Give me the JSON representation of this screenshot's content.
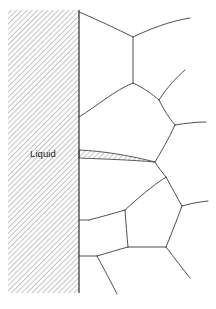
{
  "figure": {
    "type": "materials-microstructure-schematic",
    "width": 216,
    "height": 309,
    "background_color": "#ffffff"
  },
  "labels": {
    "liquid": "Liquid"
  },
  "colors": {
    "grain_boundary_line": "#3c3c3c",
    "interface_line": "#2b2b2b",
    "hatch_line": "#9a9a9a",
    "hatch_background": "#ffffff",
    "label_text": "#1a1a1a"
  },
  "regions": {
    "liquid_reservoir": {
      "name": "liquid-region",
      "fill": "diagonal-hatch",
      "hatch_angle_deg": 45,
      "hatch_spacing_px": 2.6,
      "bounds": {
        "x": 8,
        "y": 10,
        "width": 71,
        "height": 283
      }
    },
    "liquid_film": {
      "name": "liquid-penetration-wedge",
      "fill": "diagonal-hatch",
      "description": "thin wedge of liquid along grain boundary",
      "tip_x": 155,
      "tip_y": 162
    }
  },
  "geometry": {
    "interface_line": {
      "x": 79,
      "y_top": 10,
      "y_bottom": 293
    },
    "hatch_rect": {
      "x": 8,
      "y": 10,
      "width": 71,
      "height": 283
    },
    "liquid_label_pos": {
      "x": 30,
      "y": 157
    },
    "wedge_path": "M 79,150 C 104,151 132,156 155,162 C 132,160 104,159 79,158 Z",
    "grain_boundaries": [
      {
        "name": "gb-top-left-branch",
        "d": "M 79,12 C 96,19 117,29 133,37"
      },
      {
        "name": "gb-top-right-branch",
        "d": "M 133,37 C 150,29 170,21 190,18"
      },
      {
        "name": "gb-top-stem",
        "d": "M 133,37 C 133,56 133,70 133,83"
      },
      {
        "name": "gb-upper-left-face",
        "d": "M 133,83 C 115,90 97,106 79,117"
      },
      {
        "name": "gb-upper-right-face",
        "d": "M 133,83 C 144,88 152,94 159,100"
      },
      {
        "name": "gb-upper-right-spur",
        "d": "M 159,100 C 168,86 177,77 185,70"
      },
      {
        "name": "gb-right-face",
        "d": "M 159,100 C 164,110 169,118 175,125"
      },
      {
        "name": "gb-right-spur",
        "d": "M 175,125 C 187,123 197,122 206,122"
      },
      {
        "name": "gb-right-lower-face",
        "d": "M 175,125 C 168,140 161,152 155,162"
      },
      {
        "name": "gb-wedge-to-junction",
        "d": "M 155,162 C 158,167 162,172 166,177"
      },
      {
        "name": "gb-mid-right-face",
        "d": "M 166,177 C 172,188 177,197 182,206"
      },
      {
        "name": "gb-mid-right-spur",
        "d": "M 182,206 C 192,203 200,202 208,201"
      },
      {
        "name": "gb-mid-lower-right",
        "d": "M 182,206 C 176,222 171,235 166,247"
      },
      {
        "name": "gb-lower-right-spur",
        "d": "M 166,247 C 175,259 183,269 190,278"
      },
      {
        "name": "gb-lower-mid-face",
        "d": "M 166,247 C 152,247 140,247 128,247"
      },
      {
        "name": "gb-mid-left-face",
        "d": "M 166,177 C 152,186 138,198 125,210"
      },
      {
        "name": "gb-left-lower-face",
        "d": "M 125,210 C 112,214 100,217 89,220"
      },
      {
        "name": "gb-left-wall-join",
        "d": "M 89,220 C 85,220 82,220 79,220"
      },
      {
        "name": "gb-lower-left-down",
        "d": "M 125,210 C 126,224 127,236 128,247"
      },
      {
        "name": "gb-bottom-left-face",
        "d": "M 128,247 C 117,250 107,253 97,256"
      },
      {
        "name": "gb-bottom-wall-join",
        "d": "M 97,256 C 91,256 85,256 79,256"
      },
      {
        "name": "gb-bottom-stem",
        "d": "M 97,256 C 104,269 111,282 117,294"
      }
    ]
  }
}
